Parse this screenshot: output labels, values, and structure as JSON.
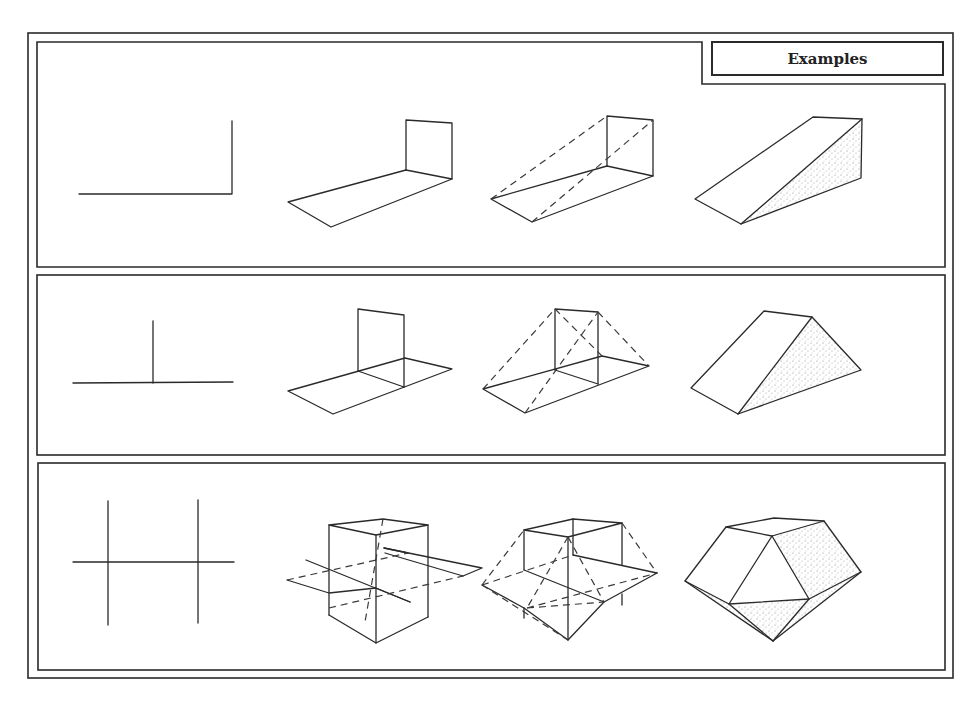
{
  "header": {
    "title": "Examples"
  },
  "panels": [
    {
      "name": "row-1-l-shape",
      "steps": [
        "two lines at right angle",
        "planes drawn",
        "construction lines (dashed)",
        "shaded wedge solid"
      ]
    },
    {
      "name": "row-2-t-shape",
      "steps": [
        "T-shaped lines",
        "planes drawn",
        "construction lines (dashed)",
        "shaded triangular prism"
      ]
    },
    {
      "name": "row-3-double-cross",
      "steps": [
        "double-cross lines",
        "box and intersecting plane",
        "construction lines (dashed)",
        "shaded polyhedron"
      ]
    }
  ],
  "colors": {
    "line": "#2a2a2a",
    "background": "#ffffff",
    "shade": "#9a9a9a"
  }
}
